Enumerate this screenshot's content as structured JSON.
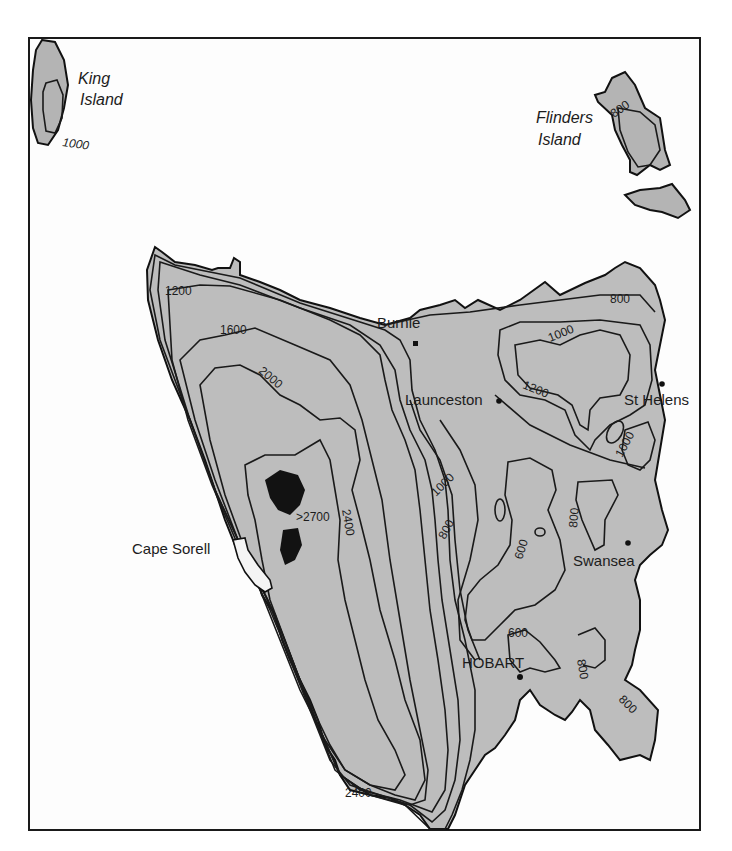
{
  "map": {
    "title": "Tasmania annual rainfall isohyets (mm)",
    "shade_colors": {
      "lt600": "#f4f4f4",
      "r600_800": "#bdbdbd",
      "r800_1000": "#a8a8a8",
      "r1000_1200": "#8f8f8f",
      "r1200_1600": "#9a9a9a",
      "r1600_2000": "#858585",
      "r2000_2400": "#6a6a6a",
      "r2400_plus": "#4a4a4a",
      "peak": "#121212",
      "sea": "#fdfdfd"
    },
    "islands": [
      {
        "name_line1": "King",
        "name_line2": "Island",
        "contour": "1000"
      },
      {
        "name_line1": "Flinders",
        "name_line2": "Island",
        "contour": "800"
      }
    ],
    "places": [
      {
        "name": "Burnie"
      },
      {
        "name": "Launceston"
      },
      {
        "name": "St Helens"
      },
      {
        "name": "Cape Sorell"
      },
      {
        "name": "Swansea"
      },
      {
        "name": "HOBART"
      }
    ],
    "contour_labels": {
      "nw_1200": "1200",
      "nw_1600": "1600",
      "w_2000": "2000",
      "peak": ">2700",
      "peak_2400": "2400",
      "south_2400": "2400",
      "ne_800": "800",
      "ne_1000": "1000",
      "ne_1200": "1200",
      "e_1000": "1000",
      "mid_1000": "1000",
      "mid_800": "800",
      "mid_600": "600",
      "swansea_800": "800",
      "hobart_600": "600",
      "se_800a": "800",
      "se_800b": "800"
    }
  }
}
